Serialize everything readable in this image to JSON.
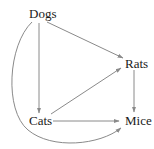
{
  "diagram": {
    "type": "directed-graph",
    "colors": {
      "edge": "#8a8a8a",
      "text": "#1a1a1a",
      "background": "#ffffff"
    },
    "nodes": [
      {
        "id": "dogs",
        "label": "Dogs"
      },
      {
        "id": "rats",
        "label": "Rats"
      },
      {
        "id": "cats",
        "label": "Cats"
      },
      {
        "id": "mice",
        "label": "Mice"
      }
    ],
    "edges": [
      {
        "from": "Dogs",
        "to": "Cats"
      },
      {
        "from": "Dogs",
        "to": "Rats"
      },
      {
        "from": "Dogs",
        "to": "Mice",
        "style": "curved"
      },
      {
        "from": "Cats",
        "to": "Rats"
      },
      {
        "from": "Cats",
        "to": "Mice"
      },
      {
        "from": "Rats",
        "to": "Mice"
      }
    ]
  }
}
